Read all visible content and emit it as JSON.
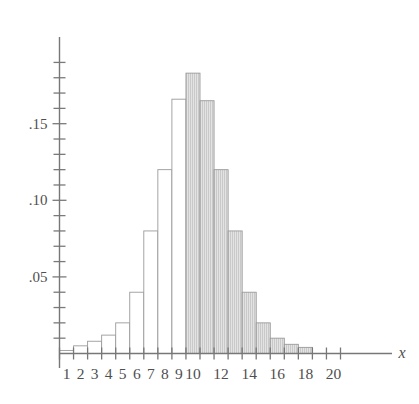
{
  "figure": {
    "name": "probability-histogram",
    "axis_name_x": "x",
    "axis_name_y": ""
  },
  "chart_data": {
    "type": "bar",
    "title": "",
    "subtitle": "",
    "xlabel": "x",
    "ylabel": "",
    "grid": false,
    "legend": null,
    "xlim": [
      0.5,
      20.5
    ],
    "ylim": [
      0,
      0.195
    ],
    "y_tick_interval": 0.01,
    "y_major_ticks": [
      0.05,
      0.1,
      0.15
    ],
    "y_major_tick_labels": [
      ".05",
      ".10",
      ".15"
    ],
    "x_tick_labels": [
      "1",
      "2",
      "3",
      "4",
      "5",
      "6",
      "7",
      "8",
      "9",
      "10",
      "12",
      "14",
      "16",
      "18",
      "20"
    ],
    "x_tick_label_values": [
      1,
      2,
      3,
      4,
      5,
      6,
      7,
      8,
      9,
      10,
      12,
      14,
      16,
      18,
      20
    ],
    "categories": [
      1,
      2,
      3,
      4,
      5,
      6,
      7,
      8,
      9,
      10,
      11,
      12,
      13,
      14,
      15,
      16,
      17,
      18,
      19,
      20
    ],
    "values": [
      0.002,
      0.005,
      0.008,
      0.012,
      0.02,
      0.04,
      0.08,
      0.12,
      0.166,
      0.183,
      0.165,
      0.12,
      0.08,
      0.04,
      0.02,
      0.01,
      0.006,
      0.004,
      0.0,
      0.0
    ],
    "bar_styles": [
      "open",
      "open",
      "open",
      "open",
      "open",
      "open",
      "open",
      "open",
      "open",
      "shaded",
      "shaded",
      "shaded",
      "shaded",
      "shaded",
      "shaded",
      "shaded",
      "shaded",
      "shaded",
      "none",
      "none"
    ],
    "shaded_region_start": 10,
    "shaded_region_end": 18,
    "colors": {
      "bar_open_fill": "#ffffff",
      "bar_shaded_fill": "#d8d8d8",
      "bar_stroke": "#9a9a9a",
      "axis": "#777777",
      "text": "#4f4f4f"
    }
  }
}
